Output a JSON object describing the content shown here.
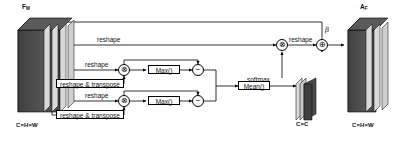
{
  "diagram": {
    "input_tensor": {
      "label": "F",
      "subscript": "M",
      "dims": "C×H×W"
    },
    "output_tensor": {
      "label": "A",
      "subscript": "F",
      "dims": "C×H×W"
    },
    "attention_map": {
      "dims": "C×C"
    },
    "edge_labels": {
      "reshape_top": "reshape",
      "reshape_b1": "reshape",
      "reshape_transpose_b1": "reshape & transpose",
      "reshape_b2": "reshape",
      "reshape_transpose_b2": "reshape & transpose",
      "softmax": "softmax",
      "reshape_out": "reshape"
    },
    "op_boxes": {
      "max_b1": "Max()",
      "max_b2": "Max()",
      "mean": "Mean()"
    },
    "nodes": {
      "multiply_b1": "⊗",
      "multiply_b2": "⊗",
      "subtract_b1": "−",
      "subtract_b2": "−",
      "multiply_out": "⊗",
      "add_out": "⊕"
    },
    "scale_parameter": "β",
    "colors": {
      "stroke": "#000000",
      "tensor_dark": "#4a4a4a",
      "tensor_light": "#d9d9d9",
      "background": "#ffffff"
    }
  }
}
